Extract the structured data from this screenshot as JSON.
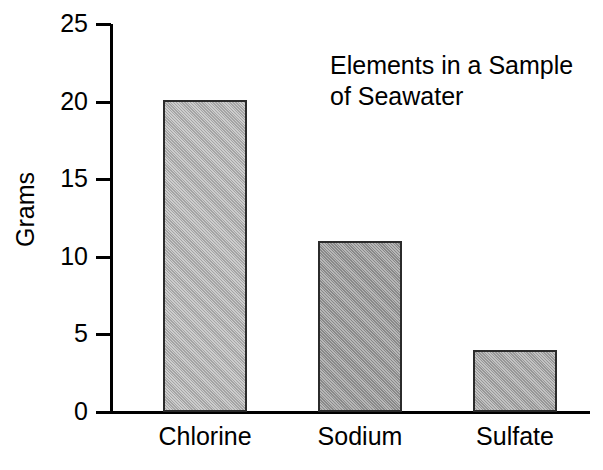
{
  "chart_data": {
    "type": "bar",
    "title": "Elements in a Sample\nof Seawater",
    "title_lines": [
      "Elements in a Sample",
      "of Seawater"
    ],
    "xlabel": "",
    "ylabel": "Grams",
    "categories": [
      "Chlorine",
      "Sodium",
      "Sulfate"
    ],
    "values": [
      20.1,
      11.0,
      4.0
    ],
    "ylim": [
      0,
      25
    ],
    "yticks": [
      0,
      5,
      10,
      15,
      20,
      25
    ],
    "ytick_labels": [
      "0",
      "5",
      "10",
      "15",
      "20",
      "25"
    ],
    "grid": false,
    "legend": false,
    "bar_colors": [
      "#b7b7b7",
      "#989898",
      "#a8a8a8"
    ],
    "bar_edge_color": "#2b2b2b",
    "axis_color": "#000000",
    "background": "#ffffff"
  },
  "ticks": [
    {
      "label": "25",
      "value": 25
    },
    {
      "label": "20",
      "value": 20
    },
    {
      "label": "15",
      "value": 15
    },
    {
      "label": "10",
      "value": 10
    },
    {
      "label": "5",
      "value": 5
    },
    {
      "label": "0",
      "value": 0
    }
  ],
  "bars": [
    {
      "label": "Chlorine",
      "value": 20.1,
      "color": "#b7b7b7"
    },
    {
      "label": "Sodium",
      "value": 11.0,
      "color": "#989898"
    },
    {
      "label": "Sulfate",
      "value": 4.0,
      "color": "#a8a8a8"
    }
  ]
}
